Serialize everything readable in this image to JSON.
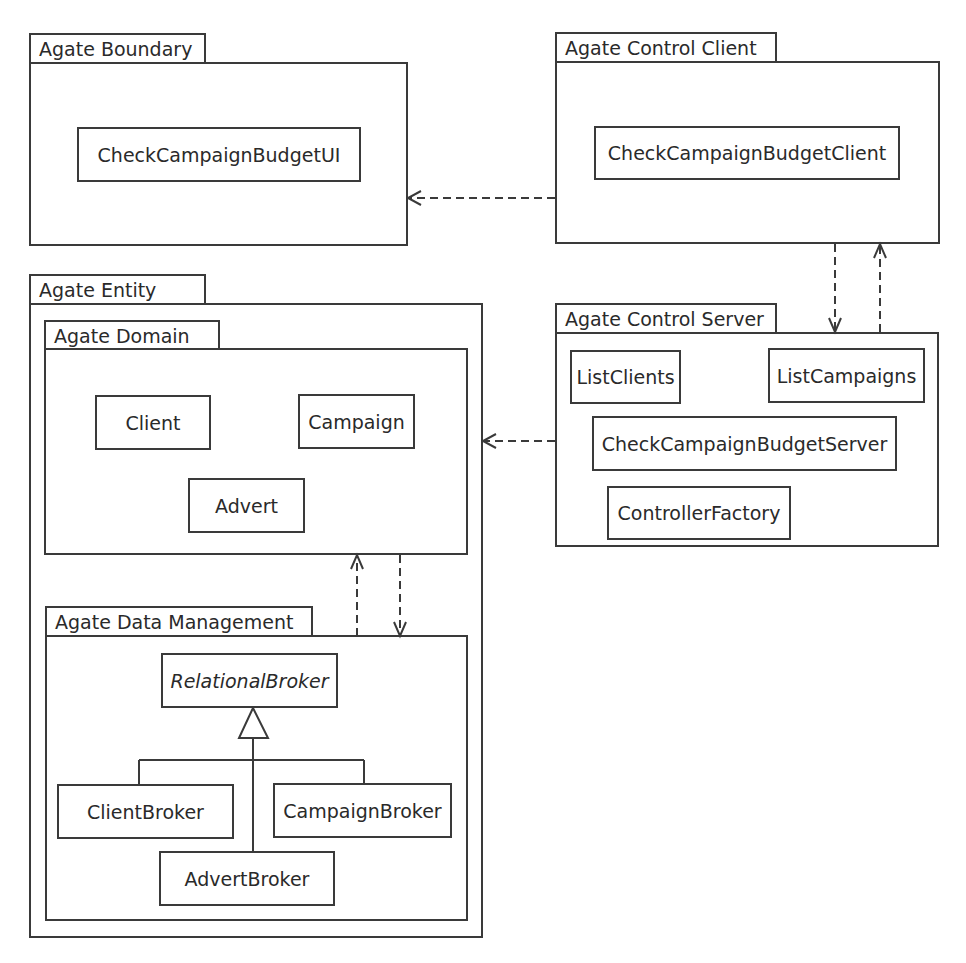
{
  "diagram": {
    "type": "UML package diagram",
    "packages": [
      {
        "id": "boundary",
        "name": "Agate Boundary",
        "classes": [
          "CheckCampaignBudgetUI"
        ]
      },
      {
        "id": "control_client",
        "name": "Agate Control Client",
        "classes": [
          "CheckCampaignBudgetClient"
        ]
      },
      {
        "id": "control_server",
        "name": "Agate Control Server",
        "classes": [
          "ListClients",
          "ListCampaigns",
          "CheckCampaignBudgetServer",
          "ControllerFactory"
        ]
      },
      {
        "id": "entity",
        "name": "Agate Entity",
        "subpackages": [
          {
            "id": "domain",
            "name": "Agate Domain",
            "classes": [
              "Client",
              "Campaign",
              "Advert"
            ]
          },
          {
            "id": "data_management",
            "name": "Agate Data Management",
            "classes": [
              "RelationalBroker",
              "ClientBroker",
              "CampaignBroker",
              "AdvertBroker"
            ],
            "abstract_classes": [
              "RelationalBroker"
            ]
          }
        ]
      }
    ],
    "dependencies": [
      {
        "from": "Agate Control Client",
        "to": "Agate Boundary"
      },
      {
        "from": "Agate Control Client",
        "to": "Agate Control Server"
      },
      {
        "from": "Agate Control Server",
        "to": "Agate Control Client"
      },
      {
        "from": "Agate Control Server",
        "to": "Agate Domain"
      },
      {
        "from": "Agate Domain",
        "to": "Agate Data Management"
      },
      {
        "from": "Agate Data Management",
        "to": "Agate Domain"
      }
    ],
    "generalizations": [
      {
        "parent": "RelationalBroker",
        "children": [
          "ClientBroker",
          "CampaignBroker",
          "AdvertBroker"
        ]
      }
    ]
  },
  "labels": {
    "boundary": "Agate Boundary",
    "control_client": "Agate Control Client",
    "control_server": "Agate Control Server",
    "entity": "Agate Entity",
    "domain": "Agate Domain",
    "data_management": "Agate Data Management",
    "check_ui": "CheckCampaignBudgetUI",
    "check_client": "CheckCampaignBudgetClient",
    "list_clients": "ListClients",
    "list_campaigns": "ListCampaigns",
    "check_server": "CheckCampaignBudgetServer",
    "controller_factory": "ControllerFactory",
    "client": "Client",
    "campaign": "Campaign",
    "advert": "Advert",
    "relational_broker": "RelationalBroker",
    "client_broker": "ClientBroker",
    "campaign_broker": "CampaignBroker",
    "advert_broker": "AdvertBroker"
  },
  "colors": {
    "line": "#3a3a3a",
    "background": "#ffffff",
    "text": "#2a2a2a"
  }
}
